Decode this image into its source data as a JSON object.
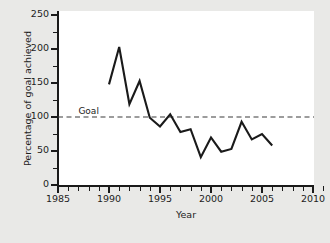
{
  "chart_data": {
    "type": "line",
    "title": "",
    "xlabel": "Year",
    "ylabel": "Percentage of goal achieved",
    "xlim": [
      1985,
      2011
    ],
    "ylim": [
      0,
      260
    ],
    "grid": false,
    "legend": null,
    "x": [
      1990,
      1991,
      1992,
      1993,
      1994,
      1995,
      1996,
      1997,
      1998,
      1999,
      2000,
      2001,
      2002,
      2003,
      2004,
      2005,
      2006
    ],
    "values": [
      148,
      203,
      119,
      153,
      99,
      86,
      104,
      78,
      82,
      41,
      70,
      49,
      53,
      93,
      67,
      75,
      58
    ],
    "series": [
      {
        "name": "Percentage of goal achieved",
        "values": [
          148,
          203,
          119,
          153,
          99,
          86,
          104,
          78,
          82,
          41,
          70,
          49,
          53,
          93,
          67,
          75,
          58
        ]
      }
    ],
    "annotations": [
      {
        "name": "goal-line",
        "type": "hline",
        "y": 100,
        "label": "Goal",
        "style": "dashed"
      }
    ],
    "x_ticks": [
      1985,
      1990,
      1995,
      2000,
      2005,
      2010
    ],
    "x_tick_labels": [
      "1985",
      "1990",
      "1995",
      "2000",
      "2005",
      "2010"
    ],
    "x_minor_step": 1,
    "y_ticks": [
      0,
      50,
      100,
      150,
      200,
      250
    ],
    "y_tick_labels": [
      "0",
      "50",
      "100",
      "150",
      "200",
      "250"
    ],
    "y_minor_step": 25,
    "line_color": "#1a1a1a",
    "goal_line_color": "#3a3a3a",
    "background_color": "#e9e9e7",
    "panel_color": "#ffffff"
  },
  "axes": {
    "y_title": "Percentage of goal achieved",
    "x_title": "Year",
    "y_labels": [
      "250",
      "200",
      "150",
      "100",
      "50",
      "0"
    ],
    "x_labels": [
      "1985",
      "1990",
      "1995",
      "2000",
      "2005",
      "2010"
    ]
  },
  "goal": {
    "label": "Goal"
  }
}
